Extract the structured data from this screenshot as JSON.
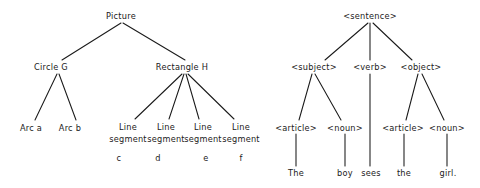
{
  "diagram": {
    "title_present": false,
    "background_color": "#ffffff",
    "text_color": "#1a1a1a",
    "edge_color": "#1a1a1a",
    "trees": [
      {
        "name": "picture-parse-tree",
        "root": "Picture",
        "nodes": [
          {
            "id": "picture",
            "label": "Picture",
            "x": 121,
            "y": 16
          },
          {
            "id": "circle",
            "label": "Circle  G",
            "x": 51,
            "y": 67
          },
          {
            "id": "rectangle",
            "label": "Rectangle  H",
            "x": 182,
            "y": 67
          },
          {
            "id": "arc-a",
            "label": "Arc  a",
            "x": 31,
            "y": 128
          },
          {
            "id": "arc-b",
            "label": "Arc  b",
            "x": 70,
            "y": 128
          },
          {
            "id": "lineseg-c",
            "label": "Line",
            "label2": "segment",
            "x": 128,
            "y": 128
          },
          {
            "id": "lineseg-d",
            "label": "Line",
            "label2": "segment",
            "x": 166,
            "y": 128
          },
          {
            "id": "lineseg-e",
            "label": "Line",
            "label2": "segment",
            "x": 203,
            "y": 128
          },
          {
            "id": "lineseg-f",
            "label": "Line",
            "label2": "segment",
            "x": 241,
            "y": 128
          },
          {
            "id": "label-c",
            "label": "c",
            "x": 119,
            "y": 158
          },
          {
            "id": "label-d",
            "label": "d",
            "x": 158,
            "y": 158
          },
          {
            "id": "label-e",
            "label": "e",
            "x": 206,
            "y": 158
          },
          {
            "id": "label-f",
            "label": "f",
            "x": 241,
            "y": 158
          }
        ]
      },
      {
        "name": "sentence-parse-tree",
        "root": "<sentence>",
        "nodes": [
          {
            "id": "sentence",
            "label": "<sentence>",
            "x": 370,
            "y": 16
          },
          {
            "id": "subject",
            "label": "<subject>",
            "x": 314,
            "y": 67
          },
          {
            "id": "verb",
            "label": "<verb>",
            "x": 370,
            "y": 67
          },
          {
            "id": "object",
            "label": "<object>",
            "x": 421,
            "y": 67
          },
          {
            "id": "article-1",
            "label": "<article>",
            "x": 296,
            "y": 128
          },
          {
            "id": "noun-1",
            "label": "<noun>",
            "x": 345,
            "y": 128
          },
          {
            "id": "article-2",
            "label": "<article>",
            "x": 403,
            "y": 128
          },
          {
            "id": "noun-2",
            "label": "<noun>",
            "x": 447,
            "y": 128
          },
          {
            "id": "word-the-1",
            "label": "The",
            "x": 296,
            "y": 173
          },
          {
            "id": "word-boy",
            "label": "boy",
            "x": 345,
            "y": 173
          },
          {
            "id": "word-sees",
            "label": "sees",
            "x": 371,
            "y": 173
          },
          {
            "id": "word-the-2",
            "label": "the",
            "x": 404,
            "y": 173
          },
          {
            "id": "word-girl",
            "label": "girl.",
            "x": 448,
            "y": 173
          }
        ]
      }
    ]
  }
}
